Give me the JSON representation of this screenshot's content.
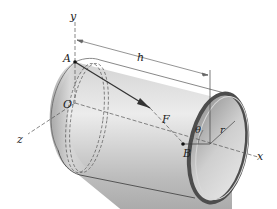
{
  "diagram": {
    "labels": {
      "y_axis": "y",
      "z_axis": "z",
      "x_axis": "x",
      "point_A": "A",
      "point_O": "O",
      "point_B": "B",
      "force": "F",
      "length": "h",
      "angle": "θ",
      "radius": "r"
    },
    "colors": {
      "shell_light": "#e6e6e6",
      "shell_mid": "#b5b5b5",
      "shell_dark": "#7d7d7d",
      "rim": "#4a4a4a",
      "line": "#333333",
      "dashed": "#555555"
    }
  }
}
